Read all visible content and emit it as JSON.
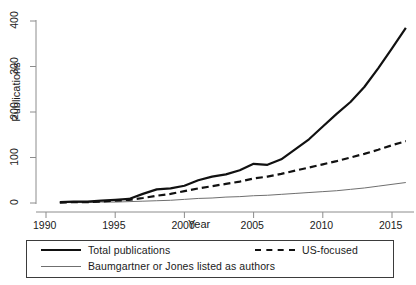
{
  "chart_data": {
    "type": "line",
    "title": "",
    "xlabel": "Year",
    "ylabel": "Publications",
    "xlim": [
      1990,
      2017
    ],
    "ylim": [
      0,
      420
    ],
    "xticks": [
      1990,
      1995,
      2000,
      2005,
      2010,
      2015
    ],
    "yticks": [
      0,
      100,
      200,
      300,
      400
    ],
    "grid": false,
    "legend_position": "below-plot",
    "x": [
      1991,
      1992,
      1993,
      1994,
      1995,
      1996,
      1997,
      1998,
      1999,
      2000,
      2001,
      2002,
      2003,
      2004,
      2005,
      2006,
      2007,
      2008,
      2009,
      2010,
      2011,
      2012,
      2013,
      2014,
      2015,
      2016
    ],
    "series": [
      {
        "name": "Total publications",
        "style": "thick-solid",
        "color": "#111111",
        "values": [
          2,
          3,
          3,
          5,
          7,
          9,
          20,
          30,
          32,
          38,
          50,
          58,
          63,
          72,
          86,
          84,
          96,
          118,
          140,
          168,
          196,
          222,
          255,
          296,
          340,
          385
        ]
      },
      {
        "name": "US-focused",
        "style": "dashed",
        "color": "#111111",
        "values": [
          1,
          2,
          2,
          3,
          5,
          7,
          11,
          16,
          20,
          26,
          32,
          37,
          42,
          47,
          54,
          58,
          64,
          71,
          78,
          85,
          92,
          100,
          108,
          117,
          127,
          136
        ]
      },
      {
        "name": "Baumgartner or Jones listed as authors",
        "style": "thin-solid",
        "color": "#6f6f6f",
        "values": [
          1,
          1,
          1,
          2,
          2,
          3,
          4,
          5,
          6,
          8,
          10,
          11,
          13,
          14,
          16,
          17,
          19,
          21,
          23,
          25,
          27,
          30,
          33,
          37,
          41,
          45
        ]
      }
    ]
  },
  "axes": {
    "y_title": "Publications",
    "x_title": "Year",
    "xtick_labels": [
      "1990",
      "1995",
      "2000",
      "2005",
      "2010",
      "2015"
    ],
    "ytick_labels": [
      "0",
      "100",
      "200",
      "300",
      "400"
    ]
  },
  "legend": {
    "total_label": "Total publications",
    "us_label": "US-focused",
    "bj_label": "Baumgartner or Jones listed as authors"
  }
}
